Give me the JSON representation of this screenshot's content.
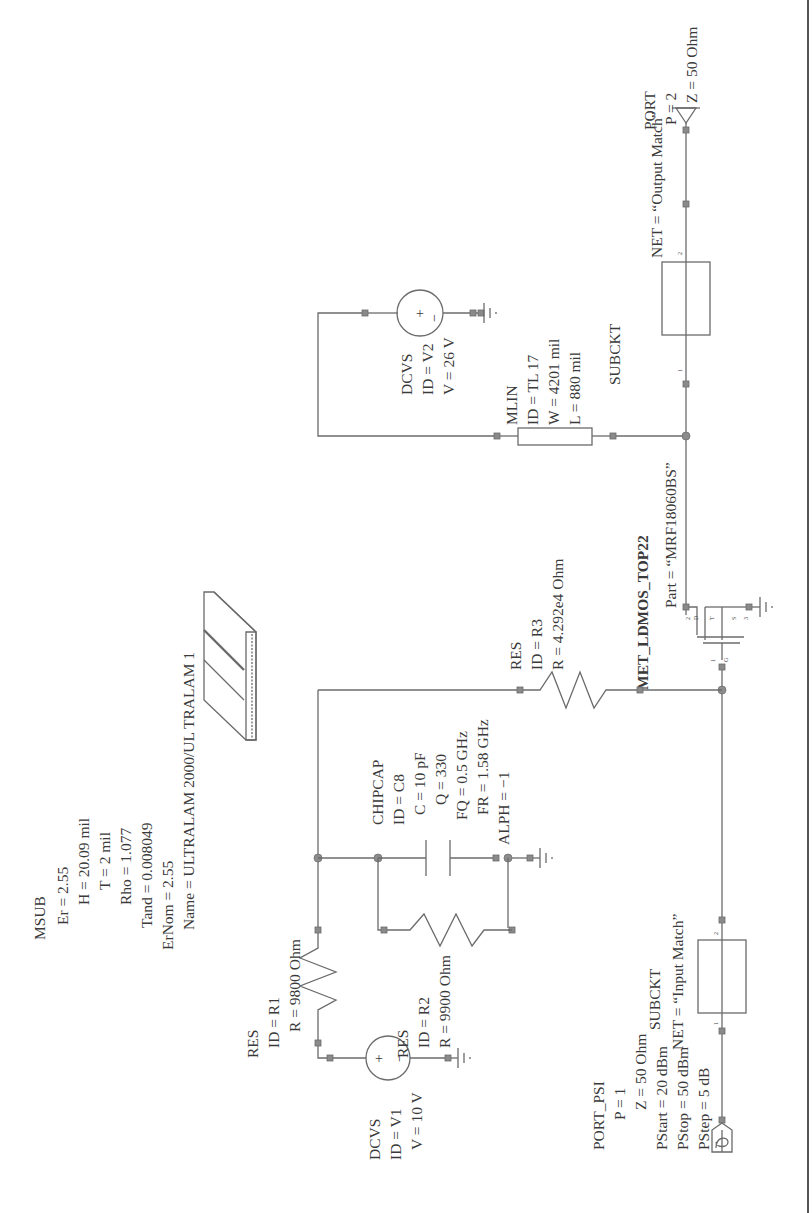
{
  "msub": {
    "type": "MSUB",
    "er": "Er = 2.55",
    "h": "H = 20.09 mil",
    "t": "T = 2 mil",
    "rho": "Rho = 1.077",
    "tand": "Tand = 0.008049",
    "ernom": "ErNom = 2.55",
    "name": "Name = ULTRALAM 2000/UL TRALAM 1"
  },
  "dcvs_v2": {
    "type": "DCVS",
    "id": "ID = V2",
    "v": "V = 26 V",
    "plus": "+",
    "minus": "−"
  },
  "mlin": {
    "type": "MLIN",
    "id": "ID = TL 17",
    "w": "W = 4201 mil",
    "l": "L = 880 mil"
  },
  "subckt_out": {
    "type": "SUBCKT",
    "net": "NET = “Output Match”",
    "pin1": "1",
    "pin2": "2"
  },
  "port2": {
    "type": "PORT",
    "p": "P = 2",
    "z": "Z = 50 Ohm"
  },
  "transistor": {
    "type": "MET_LDMOS_TOP22",
    "part": "Part = “MRF18060BS”",
    "pin1": "1",
    "pin2": "2",
    "pin3": "3",
    "g": "G",
    "d": "D",
    "s": "S",
    "t": "T"
  },
  "res_r3": {
    "type": "RES",
    "id": "ID = R3",
    "r": "R = 4.292e4 Ohm"
  },
  "chipcap": {
    "type": "CHIPCAP",
    "id": "ID = C8",
    "c": "C = 10 pF",
    "q": "Q = 330",
    "fq": "FQ = 0.5 GHz",
    "fr": "FR = 1.58 GHz",
    "alph": "ALPH = −1"
  },
  "res_r1": {
    "type": "RES",
    "id": "ID = R1",
    "r": "R = 9800 Ohm"
  },
  "res_r2": {
    "type": "RES",
    "id": "ID = R2",
    "r": "R = 9900 Ohm"
  },
  "dcvs_v1": {
    "type": "DCVS",
    "id": "ID = V1",
    "v": "V = 10 V",
    "plus": "+",
    "minus": "−"
  },
  "subckt_in": {
    "type": "SUBCKT",
    "net": "NET = “Input Match”",
    "pin1": "1",
    "pin2": "2"
  },
  "port_psi": {
    "type": "PORT_PSI",
    "p": "P = 1",
    "z": "Z = 50 Ohm",
    "pstart": "PStart = 20 dBm",
    "pstop": "PStop = 50 dBm",
    "pstep": "PStep = 5 dB"
  },
  "colors": {
    "wire": "#6b6b6b",
    "text": "#3a3a3a",
    "node": "#8a8a8a",
    "background": "#ffffff"
  }
}
